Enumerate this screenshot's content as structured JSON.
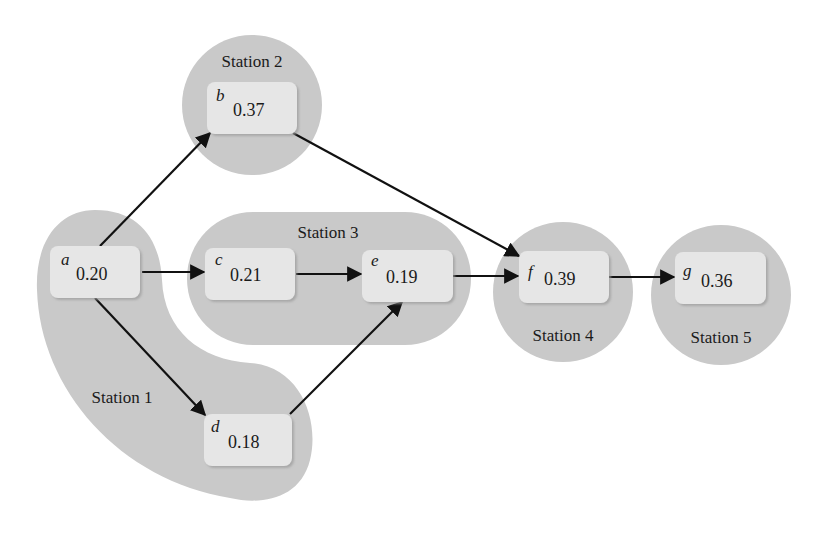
{
  "diagram": {
    "type": "precedence-network-line-balancing",
    "colors": {
      "station_fill": "#c9c9c9",
      "node_fill": "#e6e6e6",
      "edge": "#111111",
      "text": "#1a1a1a"
    },
    "stations": [
      {
        "id": "s1",
        "label": "Station 1",
        "tasks": [
          "a",
          "d"
        ]
      },
      {
        "id": "s2",
        "label": "Station 2",
        "tasks": [
          "b"
        ]
      },
      {
        "id": "s3",
        "label": "Station 3",
        "tasks": [
          "c",
          "e"
        ]
      },
      {
        "id": "s4",
        "label": "Station 4",
        "tasks": [
          "f"
        ]
      },
      {
        "id": "s5",
        "label": "Station 5",
        "tasks": [
          "g"
        ]
      }
    ],
    "nodes": [
      {
        "id": "a",
        "letter": "a",
        "value": "0.20"
      },
      {
        "id": "b",
        "letter": "b",
        "value": "0.37"
      },
      {
        "id": "c",
        "letter": "c",
        "value": "0.21"
      },
      {
        "id": "d",
        "letter": "d",
        "value": "0.18"
      },
      {
        "id": "e",
        "letter": "e",
        "value": "0.19"
      },
      {
        "id": "f",
        "letter": "f",
        "value": "0.39"
      },
      {
        "id": "g",
        "letter": "g",
        "value": "0.36"
      }
    ],
    "edges": [
      {
        "from": "a",
        "to": "b"
      },
      {
        "from": "a",
        "to": "c"
      },
      {
        "from": "a",
        "to": "d"
      },
      {
        "from": "b",
        "to": "f"
      },
      {
        "from": "c",
        "to": "e"
      },
      {
        "from": "d",
        "to": "e"
      },
      {
        "from": "e",
        "to": "f"
      },
      {
        "from": "f",
        "to": "g"
      }
    ]
  }
}
